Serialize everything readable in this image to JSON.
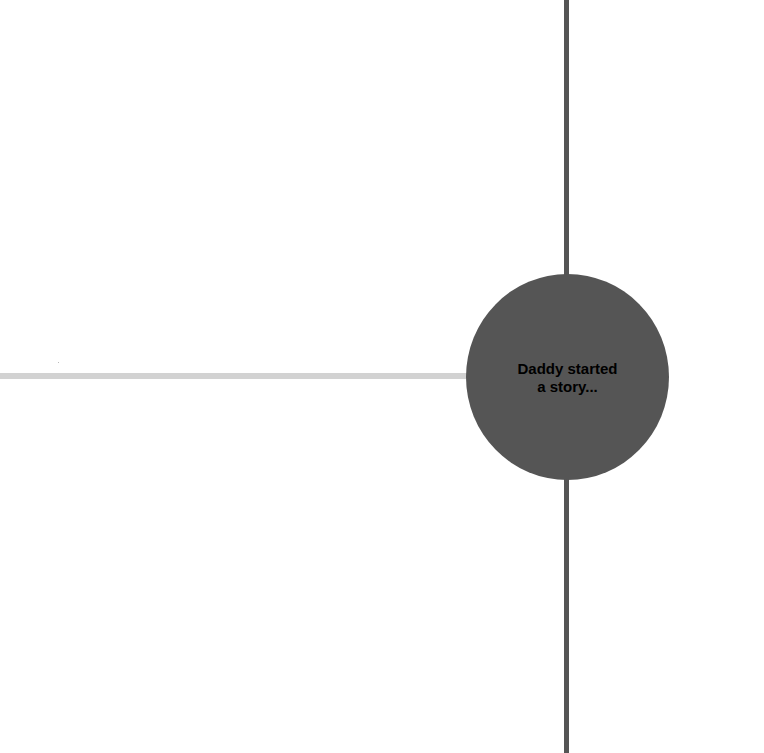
{
  "diagram": {
    "central_node": {
      "label_line1": "Daddy started",
      "label_line2": "a story...",
      "fill_color": "#555555",
      "text_color": "#000000"
    },
    "connectors": {
      "vertical": {
        "color": "#555555",
        "direction": "top-to-bottom"
      },
      "horizontal": {
        "color": "#d2d2d2",
        "direction": "left"
      }
    },
    "background_color": "#ffffff"
  }
}
